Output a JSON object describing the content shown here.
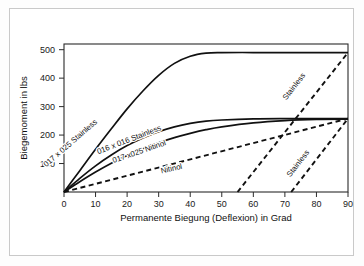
{
  "chart_data": {
    "type": "line",
    "title": "",
    "xlabel": "Permanente Biegung (Deflexion) in Grad",
    "ylabel": "Biegemoment in lbs",
    "xlim": [
      0,
      90
    ],
    "ylim": [
      0,
      520
    ],
    "xticks": [
      "0",
      "10",
      "20",
      "30",
      "40",
      "50",
      "60",
      "70",
      "80",
      "90"
    ],
    "xtick_values": [
      0,
      10,
      20,
      30,
      40,
      50,
      60,
      70,
      80,
      90
    ],
    "yticks": [
      "100",
      "200",
      "300",
      "400",
      "500"
    ],
    "ytick_values": [
      100,
      200,
      300,
      400,
      500
    ],
    "grid": false,
    "legend": "inline-curve-labels",
    "series": [
      {
        "name": "017 x 025 Stainless",
        "style": "solid",
        "label": "017 x 025 Stainless",
        "label_angle": -41,
        "x": [
          0,
          5,
          10,
          15,
          20,
          25,
          30,
          35,
          40,
          45,
          50,
          60,
          70,
          80,
          90
        ],
        "y": [
          0,
          75,
          150,
          222,
          292,
          355,
          410,
          452,
          477,
          488,
          490,
          490,
          490,
          490,
          490
        ]
      },
      {
        "name": "016 x 016 Stainless",
        "style": "solid",
        "label": "016 x 016 Stainless",
        "label_angle": -21,
        "x": [
          0,
          5,
          10,
          15,
          20,
          25,
          30,
          35,
          40,
          45,
          50,
          60,
          70,
          80,
          90
        ],
        "y": [
          0,
          48,
          92,
          130,
          163,
          190,
          212,
          229,
          241,
          249,
          253,
          257,
          258,
          258,
          258
        ]
      },
      {
        "name": "017 x025 Nitinol",
        "style": "solid",
        "label": "017 x025 Nitinol",
        "label_angle": -19,
        "x": [
          0,
          5,
          10,
          15,
          20,
          25,
          30,
          35,
          40,
          45,
          50,
          60,
          70,
          80,
          90
        ],
        "y": [
          0,
          36,
          70,
          101,
          128,
          152,
          173,
          191,
          206,
          219,
          229,
          243,
          251,
          255,
          256
        ]
      },
      {
        "name": "Nitinol",
        "style": "dashed",
        "label": "Nitinol",
        "label_angle": -13,
        "x": [
          0,
          90
        ],
        "y": [
          0,
          258
        ]
      },
      {
        "name": "Stainless unload (inner)",
        "style": "dashed",
        "label": "Stainless",
        "label_angle": -52,
        "x": [
          55,
          90
        ],
        "y": [
          0,
          490
        ]
      },
      {
        "name": "Stainless unload (outer)",
        "style": "dashed",
        "label": "Stainless",
        "label_angle": -52,
        "x": [
          72,
          90
        ],
        "y": [
          0,
          258
        ]
      }
    ],
    "annotations": [
      {
        "text": "017 x 025 Stainless",
        "x_px": 72,
        "y_px": 145,
        "angle": -41
      },
      {
        "text": "016 x 016 Stainless",
        "x_px": 130,
        "y_px": 142,
        "angle": -21
      },
      {
        "text": "017 x025 Nitinol",
        "x_px": 140,
        "y_px": 154,
        "angle": -19
      },
      {
        "text": "Nitinol",
        "x_px": 172,
        "y_px": 171,
        "angle": -13
      },
      {
        "text": "Stainless",
        "x_px": 296,
        "y_px": 88,
        "angle": -52
      },
      {
        "text": "Stainless",
        "x_px": 300,
        "y_px": 165,
        "angle": -52
      }
    ]
  }
}
